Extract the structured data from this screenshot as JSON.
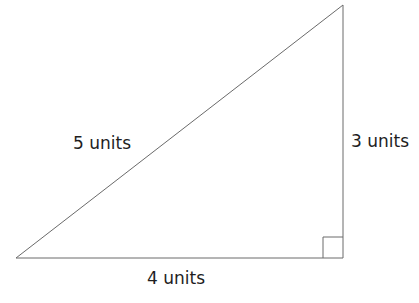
{
  "diagram": {
    "type": "right-triangle",
    "colors": {
      "line": "#6a6a6a",
      "text": "#1e1e1e",
      "background": "#ffffff"
    },
    "vertices": {
      "bottom_left": [
        16,
        258
      ],
      "bottom_right": [
        343,
        258
      ],
      "top_right": [
        343,
        5
      ]
    },
    "right_angle_marker": {
      "corner": "bottom_right",
      "size": 20
    },
    "labels": {
      "hypotenuse": "5 units",
      "vertical_leg": "3 units",
      "horizontal_leg": "4 units"
    }
  }
}
